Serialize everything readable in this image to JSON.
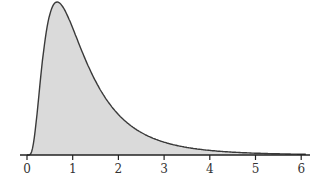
{
  "chart_data": {
    "type": "area",
    "title": "",
    "xlabel": "",
    "ylabel": "",
    "distribution": "right-skewed density (lognormal-like)",
    "params": {
      "mu": 0.047,
      "sigma": 0.68
    },
    "mode_x": 0.66,
    "xlim": [
      -0.15,
      6.2
    ],
    "x_ticks": [
      0,
      1,
      2,
      3,
      4,
      5,
      6
    ],
    "tick_labels": [
      "0",
      "1",
      "2",
      "3",
      "4",
      "5",
      "6"
    ],
    "x": [
      0,
      0.25,
      0.5,
      0.66,
      1,
      1.5,
      2,
      2.5,
      3,
      3.5,
      4,
      4.5,
      5,
      5.5,
      6
    ],
    "relative_height": [
      0,
      0.36,
      0.93,
      1.0,
      0.86,
      0.53,
      0.3,
      0.17,
      0.084,
      0.05,
      0.03,
      0.018,
      0.011,
      0.007,
      0.004
    ],
    "grid": false,
    "legend": "none",
    "fill_color": "#d9d9d9",
    "line_color": "#333333",
    "axis_color": "#222222"
  }
}
